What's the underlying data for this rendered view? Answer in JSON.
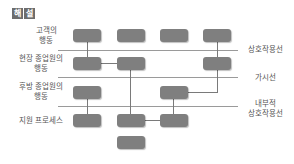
{
  "header": {
    "badge_chars": [
      "해",
      "설"
    ],
    "badge_color": "#6d6d6d"
  },
  "rows": [
    {
      "label_line1": "고객의",
      "label_line2": "행동"
    },
    {
      "label_line1": "현장 종업원의",
      "label_line2": "행동"
    },
    {
      "label_line1": "후방 종업원의",
      "label_line2": "행동"
    },
    {
      "label_line1": "지원 프로세스",
      "label_line2": ""
    }
  ],
  "lines": [
    {
      "label_line1": "상호작용선",
      "label_line2": ""
    },
    {
      "label_line1": "가시선",
      "label_line2": ""
    },
    {
      "label_line1": "내부적",
      "label_line2": "상호작용선"
    }
  ],
  "colors": {
    "box": "#7f7f7f",
    "line": "#9a9a9a"
  }
}
